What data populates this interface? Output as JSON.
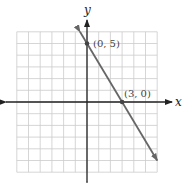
{
  "chart_data": {
    "type": "line",
    "title": "",
    "xlabel": "x",
    "ylabel": "y",
    "xlim": [
      -6,
      6
    ],
    "ylim": [
      -6,
      6
    ],
    "grid": true,
    "grid_step": 1,
    "series": [
      {
        "name": "line",
        "equation": "5x + 3y = 15",
        "slope": -1.6667,
        "intercept": 5,
        "x": [
          -0.6,
          6.0
        ],
        "y": [
          6.0,
          -5.0
        ]
      }
    ],
    "points": [
      {
        "x": 0,
        "y": 5,
        "label": "(0, 5)"
      },
      {
        "x": 3,
        "y": 0,
        "label": "(3, 0)"
      }
    ]
  },
  "labels": {
    "x_axis": "x",
    "y_axis": "y",
    "point_a": "(0, 5)",
    "point_b": "(3, 0)"
  },
  "colors": {
    "grid": "#cccccc",
    "axis": "#222222",
    "line": "#666666",
    "point": "#444444"
  }
}
